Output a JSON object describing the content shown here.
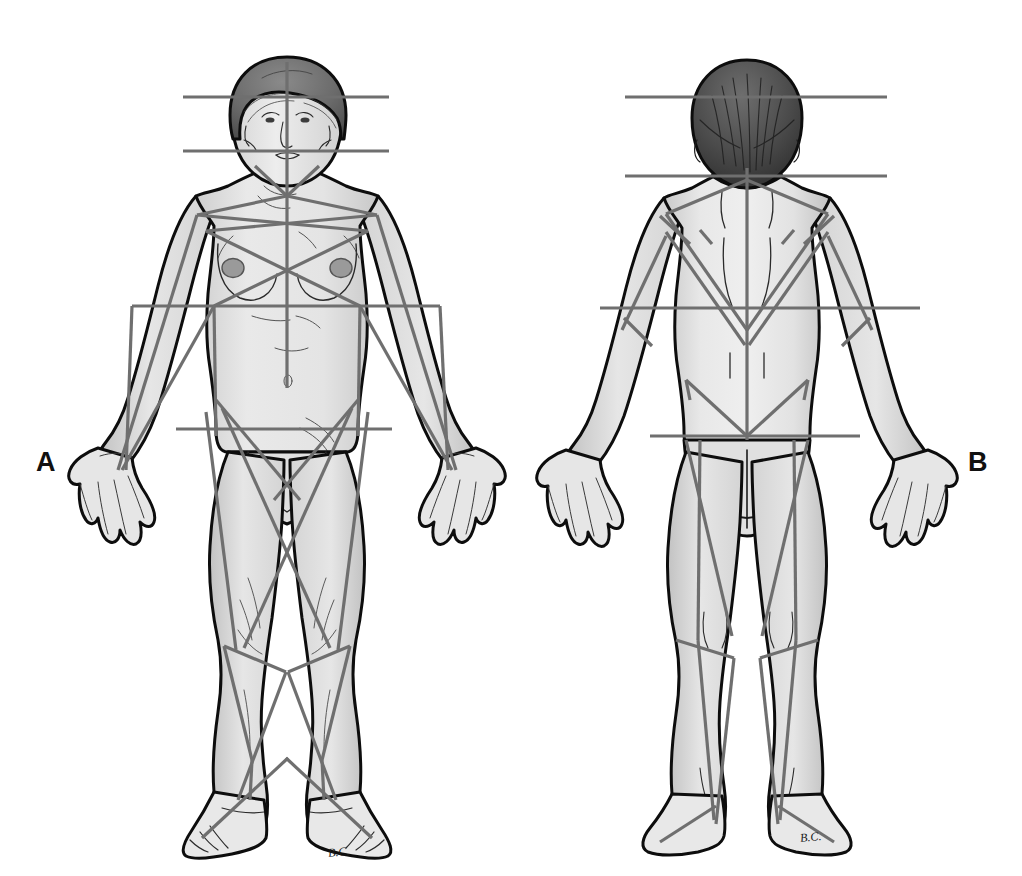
{
  "figure": {
    "background_color": "#ffffff",
    "panels": [
      {
        "id": "A",
        "label": "A",
        "view": "anterior",
        "description": "Full-body anterior (front) view of a standing female figure with straight reference lines overlaid",
        "signature": "B.C."
      },
      {
        "id": "B",
        "label": "B",
        "view": "posterior",
        "description": "Full-body posterior (back) view of a standing female figure with straight reference lines overlaid",
        "signature": "B.C."
      }
    ],
    "colors": {
      "outline": "#0d0d0d",
      "skin_fill": "#e9e9e9",
      "skin_shadow": "#c9c9c9",
      "skin_shadow_deep": "#b0b0b0",
      "hair_front": "#6d6d6d",
      "hair_back": "#4a4a4a",
      "hair_dark": "#2e2e2e",
      "reference_line": "#6f6f6f",
      "reference_line_dark": "#5a5a5a",
      "detail_line": "#3a3a3a",
      "label_text": "#111111"
    },
    "line_weights": {
      "body_outline": 3.0,
      "reference_line": 3.2,
      "detail_line": 1.0
    },
    "reference_lines": {
      "anterior": {
        "horizontal": [
          {
            "name": "forehead-line",
            "y": 97,
            "x1": 183,
            "x2": 389
          },
          {
            "name": "mouth-line",
            "y": 151,
            "x1": 183,
            "x2": 389
          },
          {
            "name": "elbow-line",
            "y": 306,
            "x1": 132,
            "x2": 440
          },
          {
            "name": "hip-line",
            "y": 429,
            "x1": 176,
            "x2": 392
          }
        ],
        "vertical": [
          {
            "name": "midline",
            "x": 287,
            "y1": 62,
            "y2": 388
          }
        ],
        "diagonal_groups": [
          "shoulder-chevron",
          "chest-cross",
          "arm-converging-lines",
          "pelvis-cross",
          "thigh-cross",
          "knee-chevron",
          "shin-diagonals",
          "ankle-foot-lines"
        ]
      },
      "posterior": {
        "horizontal": [
          {
            "name": "occiput-line",
            "y": 97,
            "x1": 625,
            "x2": 887
          },
          {
            "name": "nape-line",
            "y": 176,
            "x1": 625,
            "x2": 887
          },
          {
            "name": "elbow-line",
            "y": 308,
            "x1": 600,
            "x2": 920
          },
          {
            "name": "gluteal-line",
            "y": 436,
            "x1": 650,
            "x2": 860
          }
        ],
        "vertical": [
          {
            "name": "spine-midline",
            "x": 747,
            "y1": 168,
            "y2": 440
          }
        ],
        "diagonal_groups": [
          "upper-back-chevron",
          "scapular-chevron",
          "lumbar-chevron",
          "arm-hash-marks",
          "thigh-lines",
          "popliteal-chevron",
          "calf-lines",
          "heel-lines"
        ]
      }
    }
  }
}
